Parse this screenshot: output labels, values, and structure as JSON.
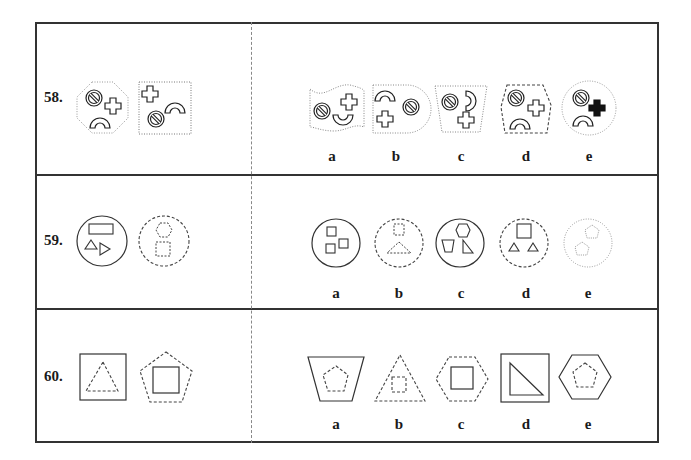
{
  "questions": [
    {
      "number": "58.",
      "prompt_figures": [
        "octagon-dotted-with-no-sign-cross-arc",
        "square-dotted-with-cross-arc-no-sign"
      ],
      "options": [
        {
          "label": "a",
          "figure": "wavy-dotted-shape-with-no-sign-cross-arc"
        },
        {
          "label": "b",
          "figure": "d-shape-dotted-with-arc-no-sign-cross"
        },
        {
          "label": "c",
          "figure": "trapezoid-dotted-with-no-sign-arc-cross"
        },
        {
          "label": "d",
          "figure": "hexagon-dashed-with-no-sign-cross-arc"
        },
        {
          "label": "e",
          "figure": "circle-dotted-with-no-sign-filled-cross-arc"
        }
      ]
    },
    {
      "number": "59.",
      "prompt_figures": [
        "circle-solid-with-rectangle-two-triangles",
        "circle-dashed-with-dashed-hexagon-square"
      ],
      "options": [
        {
          "label": "a",
          "figure": "circle-solid-with-three-squares"
        },
        {
          "label": "b",
          "figure": "circle-dashed-with-dashed-square-triangle"
        },
        {
          "label": "c",
          "figure": "circle-solid-with-hexagon-trapezoid-triangle"
        },
        {
          "label": "d",
          "figure": "circle-dashed-with-square-two-triangles"
        },
        {
          "label": "e",
          "figure": "circle-dotted-with-two-dotted-pentagons"
        }
      ]
    },
    {
      "number": "60.",
      "prompt_figures": [
        "square-solid-with-dashed-triangle",
        "pentagon-dashed-with-solid-square"
      ],
      "options": [
        {
          "label": "a",
          "figure": "trapezoid-solid-with-dashed-pentagon"
        },
        {
          "label": "b",
          "figure": "triangle-dashed-with-dashed-square"
        },
        {
          "label": "c",
          "figure": "hexagon-dashed-with-solid-square"
        },
        {
          "label": "d",
          "figure": "square-solid-with-right-triangle"
        },
        {
          "label": "e",
          "figure": "hexagon-solid-with-dashed-pentagon"
        }
      ]
    }
  ]
}
